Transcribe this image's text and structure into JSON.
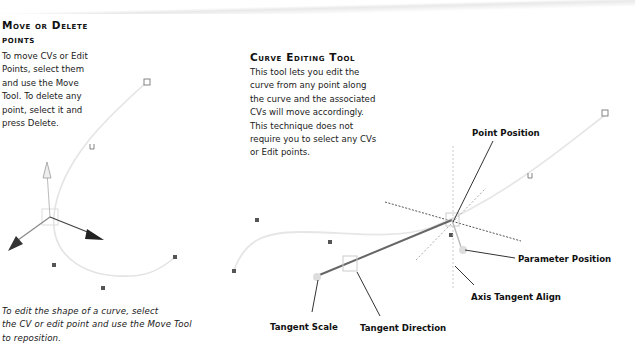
{
  "left_section": {
    "heading_line1": "Move or Delete",
    "heading_line2": "points",
    "body_lines": [
      "To move CVs or Edit",
      "Points, select them",
      "and use the Move",
      "Tool. To delete any",
      "point, select it and",
      "press Delete."
    ],
    "caption_lines": [
      "To edit the shape of a curve, select",
      "the CV or edit point and use the Move Tool",
      "to reposition."
    ],
    "figure": {
      "icons": [
        "move-manipulator-icon",
        "cv-point-icon",
        "edit-point-icon",
        "curve-start-u-icon"
      ]
    }
  },
  "right_section": {
    "heading": "Curve Editing Tool",
    "body_lines": [
      "This tool lets you edit the",
      "curve from any point along",
      "the curve and the associated",
      "CVs will move accordingly.",
      "This technique does not",
      "require you to select any CVs",
      "or Edit points."
    ],
    "labels": {
      "point_position": "Point Position",
      "parameter_position": "Parameter Position",
      "axis_tangent_align": "Axis Tangent Align",
      "tangent_scale": "Tangent Scale",
      "tangent_direction": "Tangent Direction"
    }
  },
  "colors": {
    "curve": "#e6e6e6",
    "manipulator_dark": "#333333",
    "dotted": "#555555",
    "cv_point": "#555555"
  }
}
